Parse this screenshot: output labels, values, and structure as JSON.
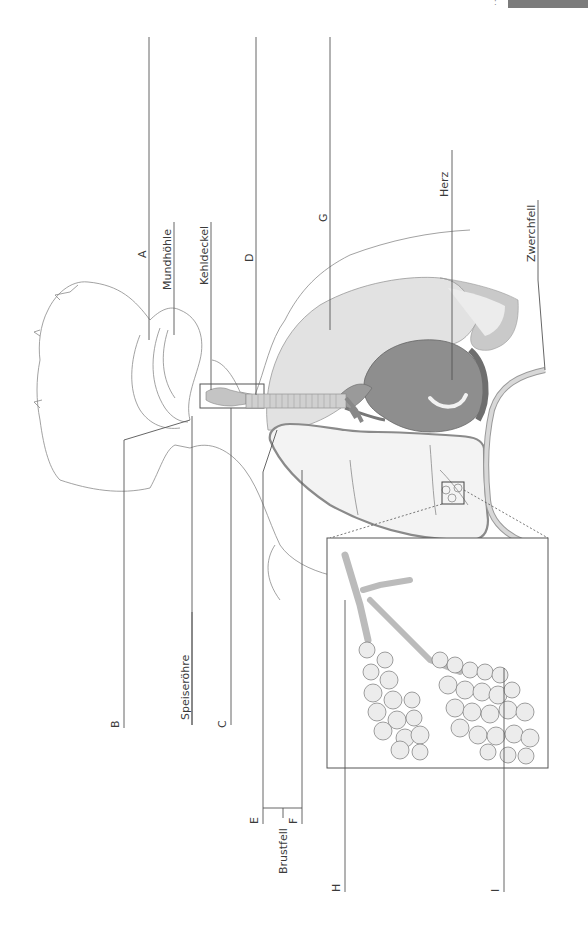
{
  "page": {
    "corner_tab_color": "#7b7b7b",
    "corner_dots": ":"
  },
  "diagram": {
    "title": "",
    "orientation": "rotated-90-ccw",
    "colors": {
      "line": "#555555",
      "outline": "#8a8a8a",
      "lung_fill": "#dcdcdc",
      "lung_light": "#efefef",
      "heart_fill": "#8e8e8e",
      "heart_dark": "#6e6e6e",
      "trachea_fill": "#c4c4c4",
      "diaphragm_fill": "#cfcfcf",
      "alveoli_fill": "#eaeaea"
    },
    "labels": {
      "a": "A",
      "mundhoehle": "Mundhöhle",
      "kehldeckel": "Kehldeckel",
      "d": "D",
      "g": "G",
      "herz": "Herz",
      "zwerchfell": "Zwerchfell",
      "b": "B",
      "speiseroehre": "Speiseröhre",
      "c": "C",
      "e": "E",
      "f": "F",
      "brustfell": "Brustfell",
      "h": "H",
      "i": "I"
    }
  }
}
